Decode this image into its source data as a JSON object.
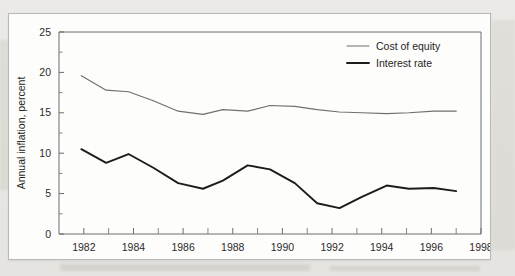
{
  "chart_data": {
    "type": "line",
    "title": "",
    "xlabel": "",
    "ylabel": "Annual inflation, percent",
    "xlim": [
      1981,
      1998
    ],
    "ylim": [
      0,
      25
    ],
    "grid": false,
    "legend_position": "top-right",
    "y_ticks": [
      0,
      5,
      10,
      15,
      20,
      25
    ],
    "y_tick_labels": [
      "0",
      "5",
      "10",
      "15",
      "20",
      "25"
    ],
    "y_minor_ticks": [
      2.5,
      7.5,
      12.5,
      17.5,
      22.5
    ],
    "x_ticks": [
      1982,
      1984,
      1986,
      1988,
      1990,
      1992,
      1994,
      1996,
      1998
    ],
    "x_tick_labels": [
      "1982",
      "1984",
      "1986",
      "1988",
      "1990",
      "1992",
      "1994",
      "1996",
      "1998"
    ],
    "x_minor_ticks": [
      1983,
      1985,
      1987,
      1989,
      1991,
      1993,
      1995,
      1997
    ],
    "x": [
      1981.9,
      1982.9,
      1983.8,
      1984.8,
      1985.8,
      1986.8,
      1987.6,
      1988.6,
      1989.5,
      1990.5,
      1991.4,
      1992.3,
      1993.2,
      1994.2,
      1995.1,
      1996.1,
      1997.0
    ],
    "series": [
      {
        "name": "Cost of equity",
        "color": "#6f6f6f",
        "width": "thin",
        "values": [
          19.6,
          17.8,
          17.6,
          16.5,
          15.2,
          14.8,
          15.4,
          15.2,
          15.9,
          15.8,
          15.4,
          15.1,
          15.0,
          14.9,
          15.0,
          15.2,
          15.2
        ]
      },
      {
        "name": "Interest rate",
        "color": "#1c1c1c",
        "width": "thick",
        "values": [
          10.5,
          8.8,
          9.9,
          8.2,
          6.3,
          5.6,
          6.6,
          8.5,
          8.0,
          6.3,
          3.8,
          3.2,
          4.6,
          6.0,
          5.6,
          5.7,
          5.3
        ]
      }
    ]
  },
  "axis": {
    "y_title": "Annual inflation, percent"
  },
  "legend": {
    "entries": [
      {
        "label": "Cost of equity"
      },
      {
        "label": "Interest rate"
      }
    ]
  }
}
